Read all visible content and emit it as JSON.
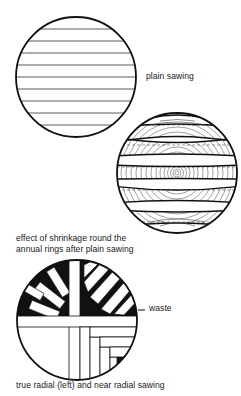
{
  "figure": {
    "type": "timber sawing methods illustration",
    "panels": [
      {
        "id": "plain-sawing",
        "caption": "plain sawing",
        "description": "log cross-section cut into parallel horizontal boards"
      },
      {
        "id": "shrinkage",
        "caption_line1": "effect of shrinkage round the",
        "caption_line2": "annual rings after plain sawing",
        "description": "boards cupped and distorted following annual ring curvature"
      },
      {
        "id": "radial-sawing",
        "caption": "true radial (left) and near radial sawing",
        "callout": "waste",
        "description": "left half radial boards, right half near-radial stepped boards with black waste wedges"
      }
    ]
  },
  "colors": {
    "ink": "#1a1a1a",
    "paper": "#ffffff"
  }
}
